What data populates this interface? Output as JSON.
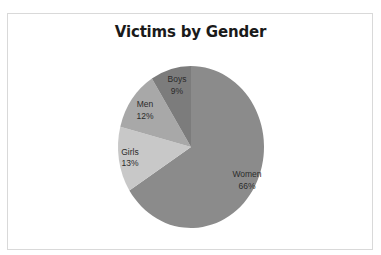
{
  "chart_data": {
    "type": "pie",
    "title": "Victims by Gender",
    "categories": [
      "Women",
      "Girls",
      "Men",
      "Boys"
    ],
    "values": [
      66,
      13,
      12,
      9
    ],
    "unit": "%",
    "start_angle": "12 o'clock",
    "direction": "clockwise",
    "legend": "none (data labels on slices)",
    "slices": [
      {
        "name": "Women",
        "value": 66,
        "label": "Women",
        "pct": "66%",
        "color": "#8b8b8b"
      },
      {
        "name": "Girls",
        "value": 13,
        "label": "Girls",
        "pct": "13%",
        "color": "#c8c8c8"
      },
      {
        "name": "Men",
        "value": 12,
        "label": "Men",
        "pct": "12%",
        "color": "#a8a8a8"
      },
      {
        "name": "Boys",
        "value": 9,
        "label": "Boys",
        "pct": "9%",
        "color": "#7c7c7c"
      }
    ]
  },
  "chart": {
    "title": "Victims by Gender"
  }
}
